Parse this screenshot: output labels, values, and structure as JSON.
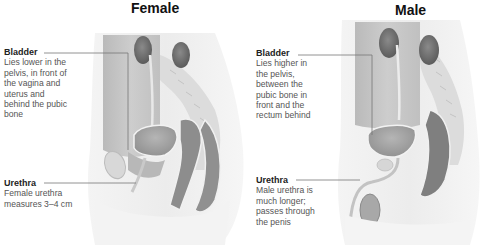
{
  "female": {
    "title": "Female",
    "bladder": {
      "heading": "Bladder",
      "text": "Lies lower in the\npelvis, in front of\nthe vagina and\nuterus and\nbehind the pubic\nbone"
    },
    "urethra": {
      "heading": "Urethra",
      "text": "Female urethra\nmeasures 3–4 cm"
    }
  },
  "male": {
    "title": "Male",
    "bladder": {
      "heading": "Bladder",
      "text": "Lies higher in\nthe pelvis,\nbetween the\npubic bone in\nfront and the\nrectum behind"
    },
    "urethra": {
      "heading": "Urethra",
      "text": "Male urethra is\nmuch longer;\npasses through\nthe penis"
    }
  },
  "colors": {
    "organ_dark": "#6f6f6f",
    "organ_mid": "#a9a9a9",
    "tissue_light": "#e6e6e6",
    "leader_line": "#777777"
  }
}
